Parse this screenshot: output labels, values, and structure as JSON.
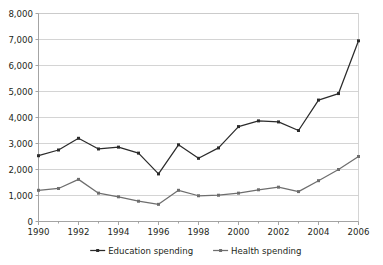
{
  "chart_data": {
    "type": "line",
    "title": "",
    "subtitle": "",
    "xlabel": "",
    "ylabel": "",
    "x": [
      1990,
      1991,
      1992,
      1993,
      1994,
      1995,
      1996,
      1997,
      1998,
      1999,
      2000,
      2001,
      2002,
      2003,
      2004,
      2005,
      2006
    ],
    "xlim": [
      1990,
      2006
    ],
    "ylim": [
      0,
      8000
    ],
    "y_ticks": [
      0,
      1000,
      2000,
      3000,
      4000,
      5000,
      6000,
      7000,
      8000
    ],
    "y_tick_labels": [
      "0",
      "1,000",
      "2,000",
      "3,000",
      "4,000",
      "5,000",
      "6,000",
      "7,000",
      "8,000"
    ],
    "x_ticks": [
      1990,
      1992,
      1994,
      1996,
      1998,
      2000,
      2002,
      2004,
      2006
    ],
    "x_tick_labels": [
      "1990",
      "1992",
      "1994",
      "1996",
      "1998",
      "2000",
      "2002",
      "2004",
      "2006"
    ],
    "x_minor_ticks": [
      1991,
      1993,
      1995,
      1997,
      1999,
      2001,
      2003,
      2005
    ],
    "grid": "horizontal",
    "legend_position": "bottom",
    "series": [
      {
        "name": "Education spending",
        "color": "#2b2b2b",
        "marker": "square",
        "values": [
          2530,
          2750,
          3200,
          2790,
          2860,
          2630,
          1830,
          2950,
          2430,
          2830,
          3650,
          3870,
          3830,
          3500,
          4670,
          4920,
          6950
        ]
      },
      {
        "name": "Health spending",
        "color": "#6e6e6e",
        "marker": "square",
        "values": [
          1200,
          1270,
          1620,
          1090,
          950,
          780,
          660,
          1200,
          990,
          1010,
          1090,
          1220,
          1320,
          1150,
          1570,
          2000,
          2500
        ]
      }
    ]
  },
  "legend": {
    "items": [
      {
        "label": "Education spending",
        "color": "#2b2b2b"
      },
      {
        "label": "Health spending",
        "color": "#6e6e6e"
      }
    ]
  },
  "colors": {
    "education": "#2b2b2b",
    "health": "#6e6e6e",
    "gridline": "#c9c9c9",
    "axis": "#9a9a9a",
    "text": "#231f20",
    "background": "#ffffff"
  }
}
